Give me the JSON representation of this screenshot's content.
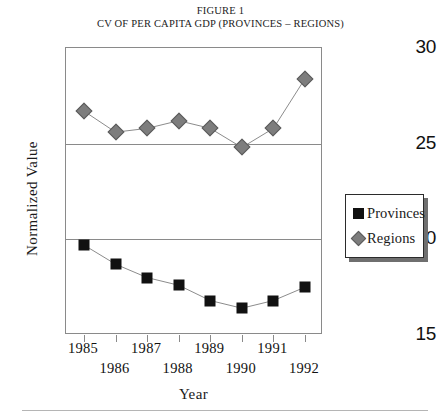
{
  "caption": {
    "line1": "FIGURE 1",
    "line2": "CV OF PER CAPITA GDP (PROVINCES – REGIONS)"
  },
  "legend": {
    "items": [
      {
        "label": "Provinces",
        "marker": "filled-square-icon",
        "color": "#111111"
      },
      {
        "label": "Regions",
        "marker": "filled-diamond-icon",
        "color": "#7d7d7d"
      }
    ]
  },
  "chart_data": {
    "type": "line",
    "title": "CV OF PER CAPITA GDP (PROVINCES – REGIONS)",
    "xlabel": "Year",
    "ylabel": "Normalized Value",
    "categories": [
      "1985",
      "1986",
      "1987",
      "1988",
      "1989",
      "1990",
      "1991",
      "1992"
    ],
    "x": [
      1985,
      1986,
      1987,
      1988,
      1989,
      1990,
      1991,
      1992
    ],
    "xticklabels": [
      "1985",
      "1986",
      "1987",
      "1988",
      "1989",
      "1990",
      "1991",
      "1992"
    ],
    "yticks": [
      15,
      20,
      25,
      30
    ],
    "yticklabels": [
      "15",
      "20",
      "25",
      "30"
    ],
    "ylim": [
      15,
      30
    ],
    "grid": true,
    "legend_position": "right",
    "series": [
      {
        "name": "Provinces",
        "color": "#111111",
        "marker": "square",
        "values": [
          19.7,
          18.7,
          18.0,
          17.6,
          16.8,
          16.4,
          16.8,
          17.5
        ]
      },
      {
        "name": "Regions",
        "color": "#7d7d7d",
        "marker": "diamond",
        "values": [
          26.7,
          25.6,
          25.8,
          26.2,
          25.8,
          24.8,
          25.8,
          28.4
        ]
      }
    ]
  }
}
